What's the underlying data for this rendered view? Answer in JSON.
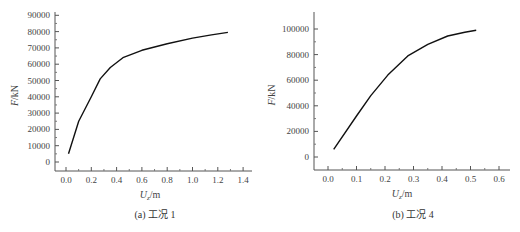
{
  "chart_data": [
    {
      "type": "line",
      "title": "",
      "caption": "(a) 工况 1",
      "xlabel": "U_z/m",
      "ylabel": "F/kN",
      "xlim": [
        -0.1,
        1.45
      ],
      "ylim": [
        -5000,
        95000
      ],
      "xticks": [
        "0.0",
        "0.2",
        "0.4",
        "0.6",
        "0.8",
        "1.0",
        "1.2",
        "1.4"
      ],
      "yticks": [
        "0",
        "10000",
        "20000",
        "30000",
        "40000",
        "50000",
        "60000",
        "70000",
        "80000",
        "90000"
      ],
      "grid": false,
      "series": [
        {
          "name": "工况 1",
          "x": [
            0.02,
            0.1,
            0.2,
            0.27,
            0.35,
            0.45,
            0.6,
            0.8,
            1.0,
            1.15,
            1.28
          ],
          "y": [
            5000,
            25000,
            40000,
            51000,
            58000,
            64000,
            68500,
            72500,
            76000,
            78000,
            79500
          ]
        }
      ]
    },
    {
      "type": "line",
      "title": "",
      "caption": "(b) 工况 4",
      "xlabel": "U_z/m",
      "ylabel": "F/kN",
      "xlim": [
        -0.05,
        0.65
      ],
      "ylim": [
        -10000,
        110000
      ],
      "xticks": [
        "0.0",
        "0.1",
        "0.2",
        "0.3",
        "0.4",
        "0.5",
        "0.6"
      ],
      "yticks": [
        "0",
        "20000",
        "40000",
        "60000",
        "80000",
        "100000"
      ],
      "grid": false,
      "series": [
        {
          "name": "工况 4",
          "x": [
            0.02,
            0.1,
            0.15,
            0.21,
            0.28,
            0.35,
            0.42,
            0.48,
            0.52
          ],
          "y": [
            6000,
            32000,
            48000,
            64000,
            79000,
            88000,
            94500,
            97500,
            99000
          ]
        }
      ]
    }
  ],
  "captions": {
    "a": "(a) 工况 1",
    "b": "(b) 工况 4"
  },
  "axes": {
    "ylabel": "F/kN",
    "xlabel_main": "U",
    "xlabel_sub": "z",
    "xlabel_unit": "/m"
  }
}
